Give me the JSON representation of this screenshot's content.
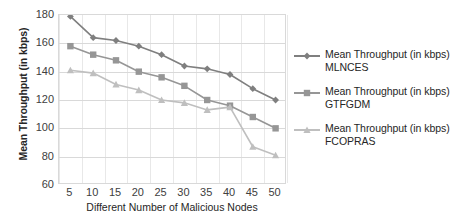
{
  "chart_data": {
    "type": "line",
    "title": "",
    "xlabel": "Different Number of Malicious Nodes",
    "ylabel": "Mean Throughput (in kbps)",
    "categories": [
      5,
      10,
      15,
      20,
      25,
      30,
      35,
      40,
      45,
      50
    ],
    "x_tick_labels": [
      "5",
      "10",
      "15",
      "20",
      "25",
      "30",
      "35",
      "40",
      "45",
      "50"
    ],
    "y_tick_labels": [
      "180",
      "160",
      "140",
      "120",
      "100",
      "80",
      "60"
    ],
    "y_ticks": [
      180,
      160,
      140,
      120,
      100,
      80,
      60
    ],
    "ylim": [
      60,
      180
    ],
    "grid": "horizontal-and-vertical",
    "legend_position": "right",
    "series": [
      {
        "name": "Mean Throughput (in kbps) MLNCES",
        "marker": "diamond",
        "color": "#7f7f7f",
        "values": [
          179,
          164,
          162,
          158,
          152,
          144,
          142,
          138,
          128,
          120
        ]
      },
      {
        "name": "Mean Throughput (in kbps) GTFGDM",
        "marker": "square",
        "color": "#969696",
        "values": [
          158,
          152,
          148,
          140,
          136,
          130,
          120,
          116,
          108,
          100
        ]
      },
      {
        "name": "Mean Throughput (in kbps) FCOPRAS",
        "marker": "triangle",
        "color": "#bfbfbf",
        "values": [
          141,
          139,
          131,
          127,
          120,
          118,
          113,
          115,
          87,
          81
        ]
      }
    ]
  },
  "legend": {
    "items": [
      {
        "label": "Mean Throughput (in kbps) MLNCES",
        "color": "#7f7f7f",
        "marker": "diamond-marker-icon"
      },
      {
        "label": "Mean Throughput (in kbps) GTFGDM",
        "color": "#969696",
        "marker": "square-marker-icon"
      },
      {
        "label": "Mean Throughput (in kbps) FCOPRAS",
        "color": "#bfbfbf",
        "marker": "triangle-marker-icon"
      }
    ]
  }
}
